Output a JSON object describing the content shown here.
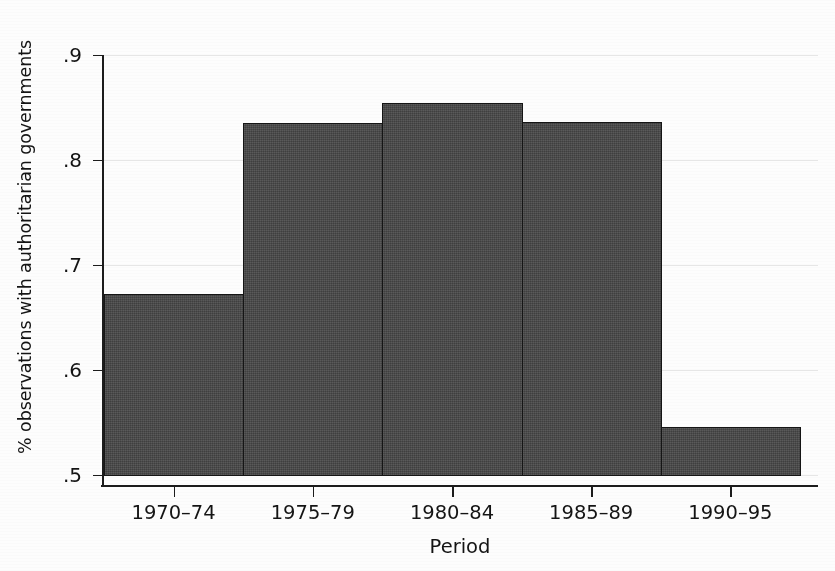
{
  "chart_data": {
    "type": "bar",
    "title": "",
    "subtitle": "",
    "xlabel": "Period",
    "ylabel": "% observations with authoritarian governments",
    "categories": [
      "1970–74",
      "1975–79",
      "1980–84",
      "1985–89",
      "1990–95"
    ],
    "values": [
      0.672,
      0.835,
      0.854,
      0.836,
      0.546
    ],
    "ylim": [
      0.5,
      0.9
    ],
    "yticks": [
      0.5,
      0.6,
      0.7,
      0.8,
      0.9
    ],
    "ytick_labels": [
      ".5",
      ".6",
      ".7",
      ".8",
      ".9"
    ],
    "grid": true,
    "grid_axis": "y",
    "legend": false,
    "legend_position": "none",
    "bar_color": "#474747",
    "bar_edge_color": "#151515",
    "grid_color": "#e6e6e6",
    "axis_color": "#1c1c1c",
    "background_color": "#ffffff",
    "bar_style": "contiguous-histogram"
  },
  "figure": {
    "axis_title_x": "Period",
    "axis_title_y": "% observations with authoritarian governments"
  }
}
